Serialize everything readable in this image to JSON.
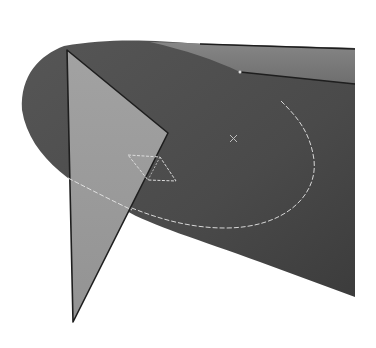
{
  "scene": {
    "description": "3D CAD view: shaded elliptical cylinder body intersected by a triangular plane with a dashed sketch ellipse",
    "colors": {
      "background": "#ffffff",
      "body_dark": "#4a4a4a",
      "body_cap": "#575757",
      "top_strip": "#7a7a7a",
      "plane_fill": "#9a9a9a",
      "edge": "#1e1e1e",
      "sketch": "#d8d8d8"
    },
    "markers": {
      "center_mark": "×",
      "center_mark_label": "ellipse-center"
    }
  }
}
